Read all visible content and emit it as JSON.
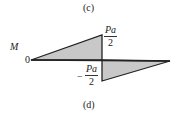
{
  "captions": {
    "top": "(c)",
    "bottom": "(d)"
  },
  "axis": {
    "ylabel": "M",
    "origin": "0"
  },
  "positive_peak": {
    "numerator": "Pa",
    "denominator": "2"
  },
  "negative_peak": {
    "sign": "−",
    "numerator": "Pa",
    "denominator": "2"
  },
  "colors": {
    "fill": "#c8c8c8",
    "stroke": "#222222"
  }
}
